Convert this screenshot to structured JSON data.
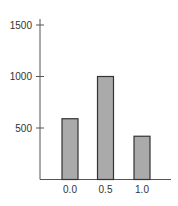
{
  "chart_data": {
    "type": "bar",
    "title": "",
    "xlabel": "",
    "ylabel": "",
    "categories": [
      "0.0",
      "0.5",
      "1.0"
    ],
    "values": [
      590,
      1000,
      420
    ],
    "ylim": [
      0,
      1500
    ],
    "yticks": [
      500,
      1000,
      1500
    ],
    "ytick_labels": [
      "500",
      "1000",
      "1500"
    ],
    "grid": false,
    "legend": null,
    "colors": {
      "bar_fill": "#aaaaaa",
      "bar_stroke": "#333333",
      "axis": "#555555",
      "text": "#333333"
    }
  }
}
